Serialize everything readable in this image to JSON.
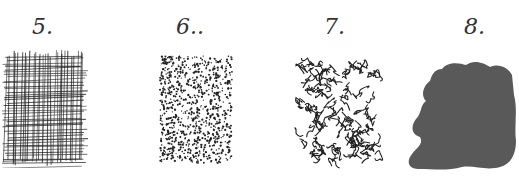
{
  "samples": [
    {
      "number": "5.",
      "technique": "crosshatching"
    },
    {
      "number": "6..",
      "technique": "stippling"
    },
    {
      "number": "7.",
      "technique": "scribbling"
    },
    {
      "number": "8.",
      "technique": "solid-tone"
    }
  ],
  "colors": {
    "ink": "#222222",
    "tone": "#595959",
    "background": "#ffffff"
  }
}
